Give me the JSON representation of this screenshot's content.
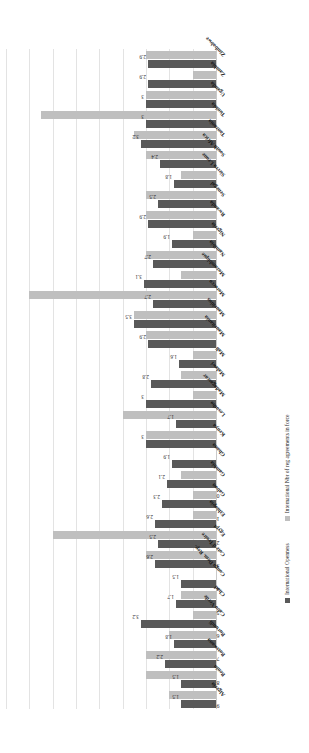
{
  "chart_data": {
    "type": "bar",
    "orientation": "vertical-rotated",
    "title": "",
    "xlabel": "",
    "ylabel": "",
    "ylim": [
      0,
      9
    ],
    "yticks": [
      0,
      1,
      2,
      3,
      4,
      5,
      6,
      7,
      8,
      9
    ],
    "grid": true,
    "legend_position": "bottom",
    "categories": [
      "Algeria",
      "Benin",
      "Botswana",
      "Burundi",
      "Cabo Verde",
      "Chad",
      "Congo Dem. Rep.",
      "Cote d'Ivoire",
      "Egypt",
      "Ethiopia",
      "Gabon",
      "Gambia",
      "Ghana",
      "Kenya",
      "Lesotho",
      "Madagascar",
      "Malawi",
      "Mali",
      "Mauritania",
      "Mauritius",
      "Morocco",
      "Mozambique",
      "Namibia",
      "Nigeria",
      "Rwanda",
      "Senegal",
      "Sierra Leone",
      "South Africa",
      "Tanzania",
      "Tunisia",
      "Uganda",
      "Zambia",
      "Zimbabwe"
    ],
    "series": [
      {
        "name": "International  Openness",
        "color": "#595959",
        "values": [
          1.5,
          1.5,
          2.2,
          1.8,
          3.2,
          1.7,
          1.5,
          2.6,
          2.5,
          2.6,
          2.3,
          2.1,
          1.9,
          3.0,
          1.7,
          3.0,
          2.8,
          1.6,
          2.9,
          3.5,
          2.7,
          3.1,
          2.7,
          1.9,
          2.9,
          2.5,
          1.8,
          2.4,
          3.2,
          3.0,
          3.0,
          2.9,
          2.9
        ],
        "labels": [
          "1.5",
          "1.5",
          "2.2",
          "1.8",
          "3.2",
          "1.7",
          "1.5",
          "2.6",
          "2.5",
          "2.6",
          "2.3",
          "2.1",
          "1.9",
          "3",
          "1.7",
          "3",
          "2.8",
          "1.6",
          "2.9",
          "3.5",
          "2.7",
          "3.1",
          "2.7",
          "1.9",
          "2.9",
          "2.5",
          "1.8",
          "2.4",
          "3.2",
          "3",
          "3",
          "2.9",
          "2.9"
        ]
      },
      {
        "name": "International  Nbr of reg agreements in force",
        "color": "#bfbfbf",
        "values": [
          2.0,
          3.0,
          3.0,
          2.0,
          1.0,
          1.5,
          0.0,
          3.0,
          7.0,
          1.0,
          1.0,
          1.5,
          0.0,
          3.0,
          4.0,
          1.0,
          1.5,
          1.0,
          3.0,
          3.5,
          8.0,
          1.5,
          3.0,
          1.0,
          3.0,
          3.0,
          1.5,
          3.0,
          3.5,
          7.5,
          3.0,
          1.0,
          3.0
        ],
        "labels": []
      }
    ]
  },
  "legend": {
    "items": [
      {
        "label": "International  Openness",
        "color": "#595959"
      },
      {
        "label": "International  Nbr of reg agreements in force",
        "color": "#bfbfbf"
      }
    ]
  }
}
